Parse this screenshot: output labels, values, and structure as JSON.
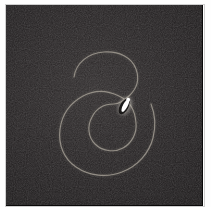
{
  "figure": {
    "title": "Dark-field micrograph of a spiral filament",
    "caption": "",
    "panel_label": "",
    "frame": {
      "x": 6,
      "y": 5,
      "width": 196,
      "height": 200,
      "background_color": "#221f20",
      "border_color": "#0a0909"
    },
    "canvas": {
      "width": 211,
      "height": 207,
      "background_color": "#fefefe"
    }
  },
  "specimen": {
    "name": "spiral-filament",
    "description": "Single faint curvilinear filament wound into an open spiral with roughly two turns, terminating near the centre.",
    "stroke_color": "#9a958c",
    "glow_color": "#6e6a63",
    "stroke_width_px": 1.15,
    "turns": 2,
    "path": "M 68 72 C 70 58, 82 48, 98 47 C 114 46, 126 53, 130 64 C 134 75, 130 84, 124 90 C 118 96, 112 99, 108 99 C 98 99, 90 104, 86 112 C 81 121, 82 132, 89 139 C 96 146, 108 148, 117 143 C 126 138, 131 128, 130 118 C 129 104, 122 95, 113 91 C 101 85, 88 85, 77 91 C 64 98, 56 110, 54 124 C 52 140, 58 154, 70 162 C 83 171, 101 173, 116 167 C 132 161, 143 148, 147 133 C 150 121, 149 109, 145 99",
    "inner_terminus": {
      "x": 113,
      "y": 97
    },
    "outer_terminus": {
      "x": 68,
      "y": 72
    }
  },
  "marker": {
    "name": "bright-particle",
    "description": "Saturated white elongated particle lying along the inner end of the filament.",
    "color": "#ffffff",
    "halo_color": "#cfcac2",
    "shadow_color": "#0c0b0b",
    "center": {
      "x": 119,
      "y": 101
    },
    "length_px": 15,
    "width_px": 5,
    "angle_deg": 62
  },
  "noise": {
    "type": "sensor-grain",
    "opacity": 0.55,
    "description": "Fine high-frequency detector noise with faint blocky compression artifacts."
  },
  "annotations": {
    "scale_bar": "",
    "axis_labels": [],
    "legend": []
  }
}
